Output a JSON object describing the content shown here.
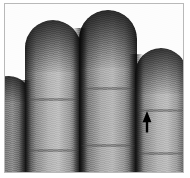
{
  "image": {
    "kind": "photograph",
    "subject": "human hand fingers close-up",
    "color_mode": "grayscale",
    "alt_text": "Grayscale close-up photograph of four fingers of a hand seen from the palmar side, with a black arrow pointing upward on the rightmost finger",
    "width_px": 190,
    "height_px": 178
  },
  "frame": {
    "border_color": "#b9b9b9",
    "background_color": "#ffffff",
    "border_width_px": 1
  },
  "fingers": [
    {
      "name": "little-finger",
      "label": "little finger",
      "position": "far-left",
      "visible": "partial-sliver"
    },
    {
      "name": "index-finger",
      "label": "index finger",
      "position": "left",
      "visible": "full"
    },
    {
      "name": "middle-finger",
      "label": "middle finger",
      "position": "center",
      "visible": "full"
    },
    {
      "name": "ring-finger",
      "label": "ring finger",
      "position": "right",
      "visible": "full"
    }
  ],
  "creases": [
    {
      "name": "index-crease-upper"
    },
    {
      "name": "index-crease-lower"
    },
    {
      "name": "middle-crease-upper"
    },
    {
      "name": "middle-crease-lower"
    },
    {
      "name": "ring-crease-upper"
    },
    {
      "name": "ring-crease-lower"
    }
  ],
  "annotation": {
    "icon": "arrow-up-icon",
    "shape": "solid filled arrow pointing up",
    "color": "#000000",
    "points_to": "ring finger pad",
    "x_px": 141,
    "y_px": 112,
    "width_px": 10,
    "height_px": 20,
    "label": ""
  },
  "palette": {
    "background": "#ffffff",
    "frame_border": "#b9b9b9",
    "skin_highlight": "#bdbdbd",
    "skin_midtone": "#8c8c8c",
    "skin_shadow": "#2b2b2b",
    "annotation": "#000000"
  }
}
